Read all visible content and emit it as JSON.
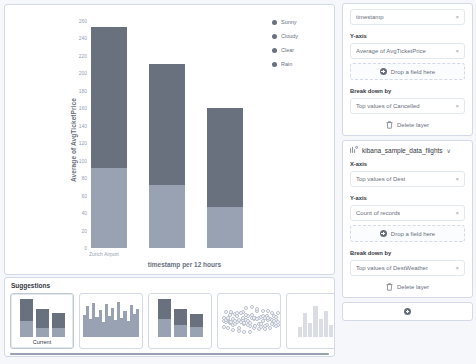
{
  "chart_data": {
    "type": "bar",
    "title": "",
    "xlabel": "timestamp per 12 hours",
    "ylabel": "Average of AvgTicketPrice",
    "ylim": [
      0,
      260
    ],
    "yticks": [
      0,
      20,
      40,
      60,
      80,
      100,
      120,
      140,
      160,
      180,
      200,
      220,
      240,
      260
    ],
    "categories": [
      "Zurich Airport",
      "",
      ""
    ],
    "category_axis_label": "Zurich Airport",
    "legend": {
      "position": "right",
      "entries": [
        {
          "label": "Sunny",
          "color": "#6a717e"
        },
        {
          "label": "Cloudy",
          "color": "#6a717e"
        },
        {
          "label": "Clear",
          "color": "#6a717e"
        },
        {
          "label": "Rain",
          "color": "#6a717e"
        }
      ]
    },
    "stacked": true,
    "series": [
      {
        "name": "Sunny",
        "color": "#98a2b3",
        "values": [
          92,
          72,
          47
        ]
      },
      {
        "name": "Cloudy",
        "color": "#6a717e",
        "values": [
          161,
          139,
          113
        ]
      }
    ],
    "totals": [
      253,
      211,
      160
    ]
  },
  "legend": {
    "items": [
      {
        "label": "Sunny"
      },
      {
        "label": "Cloudy"
      },
      {
        "label": "Clear"
      },
      {
        "label": "Rain"
      }
    ]
  },
  "suggestions": {
    "title": "Suggestions",
    "cards": [
      {
        "caption": "Current",
        "selected": true
      },
      {
        "caption": "",
        "selected": false
      },
      {
        "caption": "",
        "selected": false
      },
      {
        "caption": "",
        "selected": false
      },
      {
        "caption": "",
        "selected": false
      }
    ]
  },
  "config": {
    "layer_top": {
      "x_field": {
        "label": "timestamp",
        "remove": "×"
      },
      "y_group_label": "Y-axis",
      "y_fields": [
        {
          "label": "Average of AvgTicketPrice",
          "remove": "×"
        }
      ],
      "y_drop": {
        "label": "Drop a field here",
        "icon": "plus-circle-icon"
      },
      "break_label": "Break down by",
      "break_fields": [
        {
          "label": "Top values of Cancelled",
          "remove": "×"
        }
      ],
      "delete": {
        "label": "Delete layer",
        "icon": "trash-icon"
      }
    },
    "layer_bottom": {
      "datasource": "kibana_sample_data_flights",
      "datasource_icon": "index-pattern-icon",
      "chevron": "∨",
      "x_group_label": "X-axis",
      "x_fields": [
        {
          "label": "Top values of Dest",
          "remove": "×"
        }
      ],
      "y_group_label": "Y-axis",
      "y_fields": [
        {
          "label": "Count of records",
          "remove": "×"
        }
      ],
      "y_drop": {
        "label": "Drop a field here",
        "icon": "plus-circle-icon"
      },
      "break_label": "Break down by",
      "break_fields": [
        {
          "label": "Top values of DestWeather",
          "remove": "×"
        }
      ],
      "delete": {
        "label": "Delete layer",
        "icon": "trash-icon"
      }
    },
    "add_layer": {
      "icon": "plus-circle-icon"
    }
  }
}
